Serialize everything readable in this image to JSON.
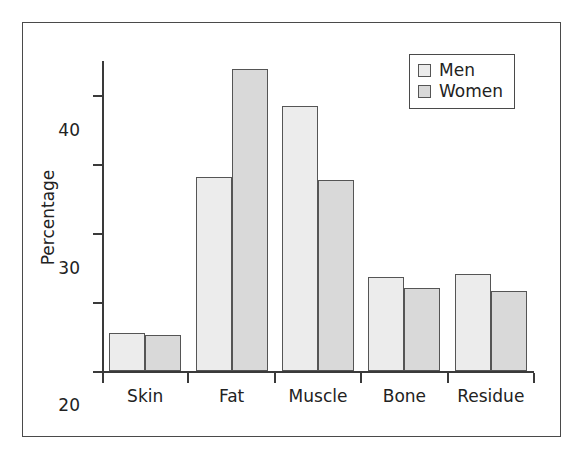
{
  "chart_data": {
    "type": "bar",
    "title": "",
    "xlabel": "",
    "ylabel": "Percentage",
    "categories": [
      "Skin",
      "Fat",
      "Muscle",
      "Bone",
      "Residue"
    ],
    "series": [
      {
        "name": "Men",
        "color": "#ececec",
        "values": [
          5.5,
          28.2,
          38.5,
          13.6,
          14.1
        ]
      },
      {
        "name": "Women",
        "color": "#d9d9d9",
        "values": [
          5.3,
          43.8,
          27.8,
          12.0,
          11.6
        ]
      }
    ],
    "ylim": [
      0,
      45
    ],
    "yticks": [
      0,
      10,
      20,
      30,
      40
    ],
    "ytick_labels": [
      "0",
      "10",
      "20",
      "30",
      "40"
    ],
    "grid": false,
    "legend_position": "top-right",
    "legend_entries": [
      "Men",
      "Women"
    ],
    "bar_edge_color": "#555555",
    "axis_color": "#3a3a3a",
    "frame_color": "#4a4a4a",
    "background": "#ffffff"
  }
}
